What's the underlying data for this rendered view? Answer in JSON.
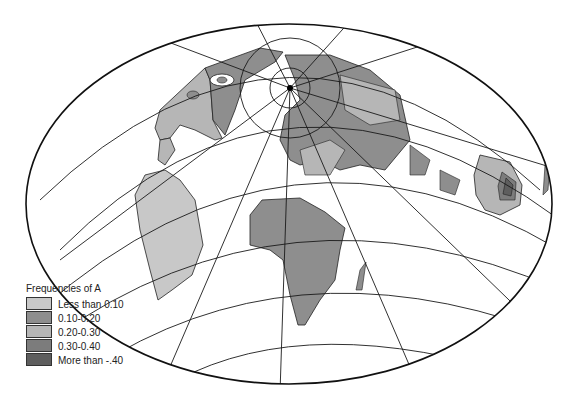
{
  "map": {
    "title": "Frequencies of A",
    "projection": "oblique equal-area (polar-centered ellipse)",
    "colors": {
      "ocean": "#ffffff",
      "graticule": "#1a1a1a",
      "lt_010": "#c8c8c8",
      "010_020": "#8e8e8e",
      "020_030": "#b6b6b6",
      "030_040": "#7c7c7c",
      "gt_040": "#5e5e5e"
    }
  },
  "legend": {
    "title": "Frequencies of A",
    "items": [
      {
        "label": "Less than 0.10",
        "color": "#c8c8c8"
      },
      {
        "label": "0.10-0.20",
        "color": "#8e8e8e"
      },
      {
        "label": "0.20-0.30",
        "color": "#b6b6b6"
      },
      {
        "label": "0.30-0.40",
        "color": "#7c7c7c"
      },
      {
        "label": "More than -.40",
        "color": "#5e5e5e"
      }
    ]
  }
}
